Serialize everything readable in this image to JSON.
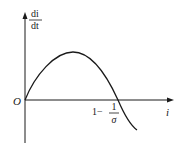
{
  "diagram": {
    "y_axis_label": {
      "numerator": "di",
      "denominator": "dt"
    },
    "x_axis_label": "i",
    "origin_label": "O",
    "root_label": {
      "prefix": "1−",
      "numerator": "1",
      "denominator": "σ"
    },
    "curve": {
      "description": "di/dt as a function of i: rises from origin to a maximum, then decreases, crossing zero at i = 1 − 1/σ and becoming negative",
      "shape": "inverted parabola"
    },
    "colors": {
      "stroke": "#1a1a1a",
      "background": "#ffffff"
    }
  }
}
